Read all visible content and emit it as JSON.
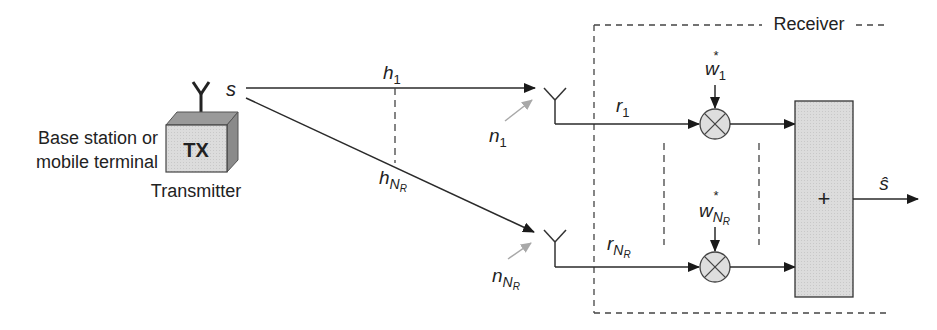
{
  "diagram": {
    "colors": {
      "line": "#2a2a2a",
      "noise_arrow": "#a8a8a8",
      "box_fill": "#dcdcdc",
      "box_side": "#8c8c8c",
      "box_top": "#a0a0a0",
      "multiplier_fill": "#dedede",
      "dashed": "#444444"
    },
    "transmitter": {
      "device_label_line1": "Base station or",
      "device_label_line2": "mobile terminal",
      "box_label": "TX",
      "caption": "Transmitter",
      "signal_label": "s"
    },
    "channels": {
      "top": {
        "label": "h",
        "sub": "1"
      },
      "bottom": {
        "label": "h",
        "sub": "N",
        "subsub": "R"
      }
    },
    "noise": {
      "top": {
        "label": "n",
        "sub": "1"
      },
      "bottom": {
        "label": "n",
        "sub": "N",
        "subsub": "R"
      }
    },
    "receiver": {
      "title": "Receiver",
      "branches": [
        {
          "signal": "r",
          "sub": "1",
          "subsub": "",
          "weight": "w",
          "weight_sub": "1",
          "weight_subsub": "",
          "conj": "*"
        },
        {
          "signal": "r",
          "sub": "N",
          "subsub": "R",
          "weight": "w",
          "weight_sub": "N",
          "weight_subsub": "R",
          "conj": "*"
        }
      ],
      "combiner_symbol": "+",
      "output_label": "ŝ"
    }
  }
}
